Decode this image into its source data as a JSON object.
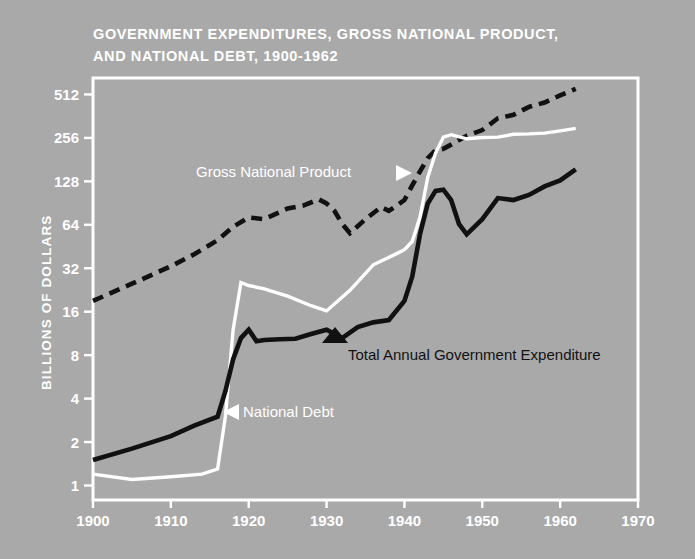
{
  "figure": {
    "title_line1": "GOVERNMENT EXPENDITURES, GROSS NATIONAL PRODUCT,",
    "title_line2": "AND NATIONAL DEBT, 1900-1962",
    "background_color": "#a9a9a9",
    "frame_color": "#ffffff"
  },
  "annotations": {
    "gnp": {
      "text": "Gross National Product",
      "color": "#ffffff",
      "marker": "right-triangle"
    },
    "expenditure": {
      "text": "Total Annual Government Expenditure",
      "color": "#111111",
      "marker": "up-triangle"
    },
    "debt": {
      "text": "National Debt",
      "color": "#ffffff",
      "marker": "left-triangle"
    }
  },
  "chart_data": {
    "type": "line",
    "title": "GOVERNMENT EXPENDITURES, GROSS NATIONAL PRODUCT, AND NATIONAL DEBT, 1900-1962",
    "xlabel": "",
    "ylabel": "BILLIONS OF DOLLARS",
    "xlim": [
      1900,
      1970
    ],
    "ylim": [
      1,
      700
    ],
    "yscale": "log",
    "xscale": "linear",
    "grid": false,
    "legend": "inline-annotations",
    "xticks": [
      1900,
      1910,
      1920,
      1930,
      1940,
      1950,
      1960,
      1970
    ],
    "xticklabels": [
      "1900",
      "1910",
      "1920",
      "1930",
      "1940",
      "1950",
      "1960",
      "1970"
    ],
    "yticks": [
      1,
      2,
      4,
      8,
      16,
      32,
      64,
      128,
      256,
      512
    ],
    "yticklabels": [
      "1",
      "2",
      "4",
      "8",
      "16",
      "32",
      "64",
      "128",
      "256",
      "512"
    ],
    "series": [
      {
        "name": "Gross National Product",
        "style": "dashed",
        "color": "#111111",
        "x": [
          1900,
          1905,
          1910,
          1913,
          1916,
          1918,
          1920,
          1922,
          1925,
          1927,
          1929,
          1930,
          1931,
          1932,
          1933,
          1935,
          1937,
          1938,
          1939,
          1940,
          1941,
          1942,
          1943,
          1944,
          1945,
          1946,
          1948,
          1950,
          1952,
          1954,
          1956,
          1958,
          1960,
          1962
        ],
        "values": [
          19,
          25,
          33,
          40,
          50,
          62,
          72,
          70,
          83,
          87,
          96,
          90,
          80,
          65,
          56,
          70,
          85,
          80,
          87,
          95,
          120,
          150,
          185,
          210,
          215,
          230,
          265,
          290,
          350,
          370,
          420,
          450,
          505,
          560
        ]
      },
      {
        "name": "National Debt",
        "style": "solid",
        "color": "#ffffff",
        "x": [
          1900,
          1905,
          1910,
          1914,
          1916,
          1917,
          1918,
          1919,
          1920,
          1922,
          1925,
          1928,
          1930,
          1933,
          1936,
          1939,
          1940,
          1941,
          1942,
          1943,
          1944,
          1945,
          1946,
          1948,
          1950,
          1952,
          1954,
          1956,
          1958,
          1960,
          1962
        ],
        "values": [
          1.2,
          1.1,
          1.15,
          1.2,
          1.3,
          3.0,
          12.0,
          25.5,
          24.3,
          23.0,
          20.5,
          17.6,
          16.2,
          22.5,
          33.8,
          40.4,
          43.0,
          49.0,
          72.4,
          136.7,
          201.0,
          258.7,
          269.4,
          252.3,
          257.4,
          259.1,
          271.3,
          272.8,
          276.4,
          286.3,
          298.2
        ]
      },
      {
        "name": "Total Annual Government Expenditure",
        "style": "solid",
        "color": "#111111",
        "x": [
          1900,
          1905,
          1910,
          1913,
          1916,
          1917,
          1918,
          1919,
          1920,
          1921,
          1922,
          1924,
          1926,
          1928,
          1930,
          1932,
          1934,
          1936,
          1938,
          1940,
          1941,
          1942,
          1943,
          1944,
          1945,
          1946,
          1947,
          1948,
          1950,
          1952,
          1954,
          1956,
          1958,
          1960,
          1962
        ],
        "values": [
          1.5,
          1.8,
          2.2,
          2.6,
          3.0,
          4.5,
          7.5,
          10.5,
          12.0,
          10.0,
          10.2,
          10.3,
          10.4,
          11.2,
          12.0,
          10.5,
          12.5,
          13.5,
          14.0,
          19.0,
          28.0,
          55.0,
          90.0,
          110.0,
          112.0,
          95.0,
          65.0,
          55.0,
          70.0,
          98.0,
          95.0,
          103.0,
          118.0,
          130.0,
          155.0
        ]
      }
    ]
  }
}
